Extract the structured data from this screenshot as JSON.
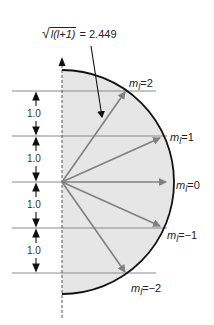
{
  "title_label": {
    "radicand": "l(l+1)",
    "equals": " = 2.449"
  },
  "spacing_labels": [
    "1.0",
    "1.0",
    "1.0",
    "1.0"
  ],
  "ml_labels": [
    {
      "prefix": "m",
      "sub": "l",
      "value": "=2"
    },
    {
      "prefix": "m",
      "sub": "l",
      "value": "=1"
    },
    {
      "prefix": "m",
      "sub": "l",
      "value": "=0"
    },
    {
      "prefix": "m",
      "sub": "l",
      "value": "=−1"
    },
    {
      "prefix": "m",
      "sub": "l",
      "value": "=−2"
    }
  ],
  "colors": {
    "fill": "#e6e6e6",
    "arc": "#111111",
    "vector": "#808080",
    "level_line": "#8a8a8a",
    "axis": "#555555"
  }
}
